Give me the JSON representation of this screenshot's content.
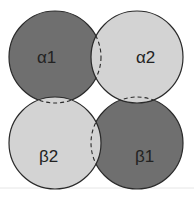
{
  "diagram": {
    "type": "overlapping-circles",
    "colors": {
      "dark": "#6f6f6f",
      "light": "#d3d3d3",
      "stroke": "#2a2a2a",
      "baseline": "#e4e4e4"
    },
    "subunits": [
      {
        "id": "alpha1",
        "label": "α1",
        "shade": "dark",
        "cx": 55,
        "cy": 57,
        "r": 46
      },
      {
        "id": "alpha2",
        "label": "α2",
        "shade": "light",
        "cx": 137,
        "cy": 57,
        "r": 46
      },
      {
        "id": "beta2",
        "label": "β2",
        "shade": "light",
        "cx": 55,
        "cy": 143,
        "r": 46
      },
      {
        "id": "beta1",
        "label": "β1",
        "shade": "dark",
        "cx": 137,
        "cy": 143,
        "r": 46
      }
    ]
  }
}
